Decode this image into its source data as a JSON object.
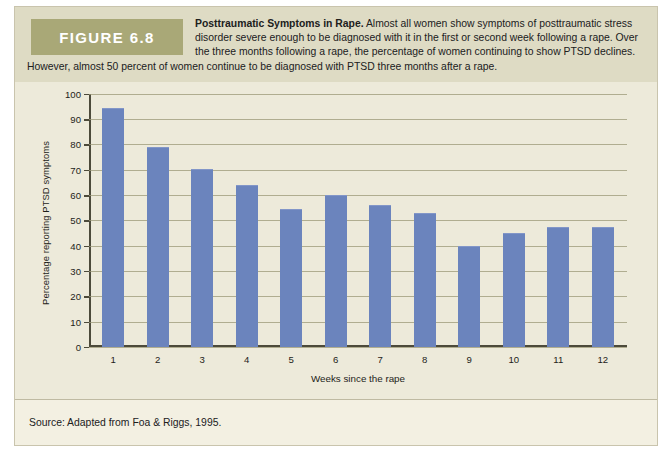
{
  "figure": {
    "badge_label": "FIGURE 6.8",
    "caption_title": "Posttraumatic Symptoms in Rape.",
    "caption_body": " Almost all women show symptoms of posttraumatic stress disorder severe enough to be diagnosed with it in the first or second week following a rape. Over the three months following a rape, the percentage of women continuing to show PTSD declines. However, almost 50 percent of women continue to be diagnosed with PTSD three months after a rape.",
    "source": "Source: Adapted from Foa & Riggs, 1995."
  },
  "colors": {
    "bar": "#6b84bd",
    "badge_bg": "#a9a877",
    "caption_bg": "#dedbc4",
    "plot_bg": "#edeada",
    "card_bg": "#f3f0e2",
    "grid": "#9b9877",
    "axis": "#4c4a3a"
  },
  "chart_data": {
    "type": "bar",
    "title": "Posttraumatic Symptoms in Rape",
    "xlabel": "Weeks since the rape",
    "ylabel": "Percentage reporting PTSD symptoms",
    "categories": [
      "1",
      "2",
      "3",
      "4",
      "5",
      "6",
      "7",
      "8",
      "9",
      "10",
      "11",
      "12"
    ],
    "values": [
      94,
      78.5,
      70,
      63.5,
      54,
      59.5,
      55.5,
      52.5,
      39.5,
      44.5,
      47,
      47
    ],
    "ylim": [
      0,
      100
    ],
    "ytick_labels": [
      "100",
      "90",
      "80",
      "70",
      "60",
      "50",
      "40",
      "30",
      "20",
      "10",
      "0"
    ],
    "ytick_values": [
      100,
      90,
      80,
      70,
      60,
      50,
      40,
      30,
      20,
      10,
      0
    ],
    "grid": true,
    "legend": false,
    "series_name": "Percentage reporting PTSD symptoms"
  }
}
